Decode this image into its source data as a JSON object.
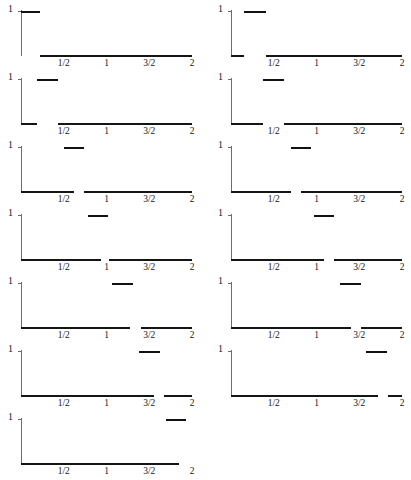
{
  "figure": {
    "title": "",
    "columns": 2,
    "panel_count": 13,
    "axis": {
      "x_min": 0,
      "x_max": 2,
      "y_min": 0,
      "y_max": 1,
      "y_tick_label": "1",
      "x_tick_labels": [
        "1/2",
        "1",
        "3/2",
        "2"
      ],
      "x_tick_values": [
        0.5,
        1,
        1.5,
        2
      ]
    },
    "colors": {
      "axis": "#6d6d6d",
      "baseline": "#151515",
      "bump": "#111111",
      "background": "#ffffff",
      "text": "#171717"
    }
  },
  "chart_data": {
    "type": "line",
    "xlabel": "",
    "ylabel": "",
    "xlim": [
      0,
      2
    ],
    "ylim": [
      0,
      1
    ],
    "grid": false,
    "legend": "none",
    "x_tick_labels": [
      "1/2",
      "1",
      "3/2",
      "2"
    ],
    "x_tick_values": [
      0.5,
      1,
      1.5,
      2
    ],
    "y_tick_labels": [
      "1"
    ],
    "y_tick_values": [
      1
    ],
    "panels": [
      {
        "index": 1,
        "column": "left",
        "row": 1,
        "bump_start": 0.0,
        "bump_end": 0.22,
        "bump_height": 1,
        "baseline_gap": [
          0.0,
          0.22
        ]
      },
      {
        "index": 2,
        "column": "right",
        "row": 1,
        "bump_start": 0.15,
        "bump_end": 0.41,
        "bump_height": 1,
        "baseline_gap": [
          0.15,
          0.41
        ]
      },
      {
        "index": 3,
        "column": "left",
        "row": 2,
        "bump_start": 0.19,
        "bump_end": 0.43,
        "bump_height": 1,
        "baseline_gap": [
          0.19,
          0.43
        ]
      },
      {
        "index": 4,
        "column": "right",
        "row": 2,
        "bump_start": 0.38,
        "bump_end": 0.62,
        "bump_height": 1,
        "baseline_gap": [
          0.38,
          0.62
        ]
      },
      {
        "index": 5,
        "column": "left",
        "row": 3,
        "bump_start": 0.5,
        "bump_end": 0.74,
        "bump_height": 1,
        "baseline_gap": [
          0.62,
          0.74
        ]
      },
      {
        "index": 6,
        "column": "right",
        "row": 3,
        "bump_start": 0.7,
        "bump_end": 0.94,
        "bump_height": 1,
        "baseline_gap": [
          0.7,
          0.82
        ]
      },
      {
        "index": 7,
        "column": "left",
        "row": 4,
        "bump_start": 0.78,
        "bump_end": 1.02,
        "bump_height": 1,
        "baseline_gap": [
          0.93,
          1.03
        ]
      },
      {
        "index": 8,
        "column": "right",
        "row": 4,
        "bump_start": 0.97,
        "bump_end": 1.21,
        "bump_height": 1,
        "baseline_gap": [
          1.09,
          1.21
        ]
      },
      {
        "index": 9,
        "column": "left",
        "row": 5,
        "bump_start": 1.07,
        "bump_end": 1.31,
        "bump_height": 1,
        "baseline_gap": [
          1.27,
          1.4
        ]
      },
      {
        "index": 10,
        "column": "right",
        "row": 5,
        "bump_start": 1.28,
        "bump_end": 1.52,
        "bump_height": 1,
        "baseline_gap": [
          1.4,
          1.52
        ]
      },
      {
        "index": 11,
        "column": "left",
        "row": 6,
        "bump_start": 1.38,
        "bump_end": 1.62,
        "bump_height": 1,
        "baseline_gap": [
          1.55,
          1.67
        ]
      },
      {
        "index": 12,
        "column": "right",
        "row": 6,
        "bump_start": 1.58,
        "bump_end": 1.82,
        "bump_height": 1,
        "baseline_gap": [
          1.72,
          1.84
        ]
      },
      {
        "index": 13,
        "column": "left",
        "row": 7,
        "bump_start": 1.7,
        "bump_end": 1.93,
        "bump_height": 1,
        "baseline_gap": [
          1.85,
          2.0
        ]
      }
    ]
  }
}
